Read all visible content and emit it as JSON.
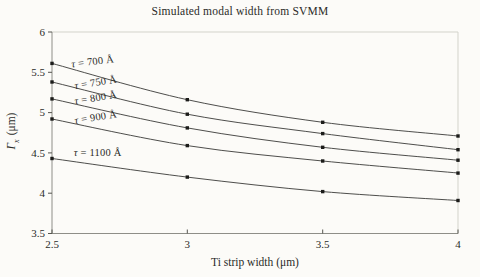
{
  "figure": {
    "background": "#fcfbf8"
  },
  "chart_data": {
    "type": "line",
    "title": "Simulated modal width from SVMM",
    "xlabel": "Ti strip width (μm)",
    "ylabel": {
      "symbol": "Γ",
      "subscript": "x",
      "unit": "(μm)"
    },
    "x": [
      2.5,
      3.0,
      3.5,
      4.0
    ],
    "xlim": [
      2.5,
      4.0
    ],
    "ylim": [
      3.5,
      6.0
    ],
    "x_ticks": [
      "2.5",
      "3",
      "3.5",
      "4"
    ],
    "y_ticks": [
      "3.5",
      "4",
      "4.5",
      "5",
      "5.5",
      "6"
    ],
    "grid": false,
    "legend": "inline-labels",
    "marker": "square",
    "colors": {
      "line": "#3a3a38",
      "marker": "#1c1c1a",
      "axis": "#8e8e88",
      "axis_light": "#d3d3cb",
      "tick": "#55554f",
      "text": "#2b2b28"
    },
    "series": [
      {
        "name": "τ = 700 Å",
        "values": [
          5.61,
          5.16,
          4.88,
          4.71
        ],
        "label_x": 2.573,
        "label_y": 5.56,
        "label_rot": -7
      },
      {
        "name": "τ = 750 Å",
        "values": [
          5.38,
          4.98,
          4.74,
          4.54
        ],
        "label_x": 2.585,
        "label_y": 5.29,
        "label_rot": -9
      },
      {
        "name": "τ = 800 Å",
        "values": [
          5.17,
          4.81,
          4.57,
          4.41
        ],
        "label_x": 2.585,
        "label_y": 5.1,
        "label_rot": -9
      },
      {
        "name": "τ = 900 Å",
        "values": [
          4.92,
          4.59,
          4.4,
          4.25
        ],
        "label_x": 2.585,
        "label_y": 4.86,
        "label_rot": -9
      },
      {
        "name": "τ = 1100 Å",
        "values": [
          4.43,
          4.2,
          4.02,
          3.91
        ],
        "label_x": 2.58,
        "label_y": 4.46,
        "label_rot": 0
      }
    ]
  }
}
